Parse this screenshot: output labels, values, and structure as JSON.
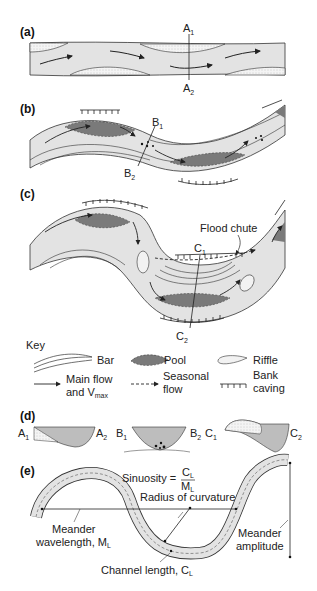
{
  "panels": {
    "a": {
      "label": "(a)",
      "section_top": "A",
      "section_top_sub": "1",
      "section_bottom": "A",
      "section_bottom_sub": "2"
    },
    "b": {
      "label": "(b)",
      "section_top": "B",
      "section_top_sub": "1",
      "section_bottom": "B",
      "section_bottom_sub": "2"
    },
    "c": {
      "label": "(c)",
      "section_top": "C",
      "section_top_sub": "1",
      "section_bottom": "C",
      "section_bottom_sub": "2",
      "flood_chute": "Flood chute"
    },
    "d": {
      "label": "(d)",
      "profiles": [
        {
          "left": "A",
          "left_sub": "1",
          "right": "A",
          "right_sub": "2"
        },
        {
          "left": "B",
          "left_sub": "1",
          "right": "B",
          "right_sub": "2"
        },
        {
          "left": "C",
          "left_sub": "1",
          "right": "C",
          "right_sub": "2"
        }
      ]
    },
    "e": {
      "label": "(e)",
      "sinuosity": "Sinuosity =",
      "sinuosity_num": "C",
      "sinuosity_num_sub": "L",
      "sinuosity_den": "M",
      "sinuosity_den_sub": "L",
      "radius": "Radius of curvature",
      "wavelength_1": "Meander",
      "wavelength_2": "wavelength, M",
      "wavelength_sub": "L",
      "amplitude_1": "Meander",
      "amplitude_2": "amplitude",
      "channel_length": "Channel length, C",
      "channel_length_sub": "L"
    }
  },
  "key": {
    "title": "Key",
    "items": [
      {
        "name": "bar",
        "label": "Bar"
      },
      {
        "name": "pool",
        "label": "Pool"
      },
      {
        "name": "riffle",
        "label": "Riffle"
      },
      {
        "name": "main-flow",
        "label_1": "Main flow",
        "label_2": "and V",
        "label_sub": "max"
      },
      {
        "name": "seasonal-flow",
        "label_1": "Seasonal",
        "label_2": "flow"
      },
      {
        "name": "bank-caving",
        "label_1": "Bank",
        "label_2": "caving"
      }
    ]
  },
  "colors": {
    "channel": "#e3e3e3",
    "pool": "#7a7a7a",
    "line": "#333333",
    "bar_dots": "#bdbdbd"
  }
}
